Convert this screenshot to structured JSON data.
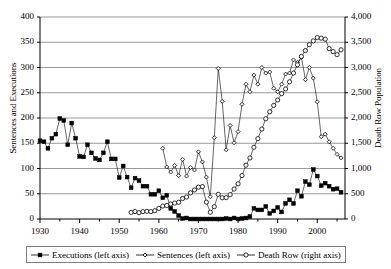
{
  "chart_data": {
    "type": "line",
    "title": "",
    "xlabel": "",
    "ylabel": "Sentences and Executions",
    "y2label": "Death Row Population",
    "xlim": [
      1930,
      2007
    ],
    "ylim": [
      0,
      400
    ],
    "y2lim": [
      0,
      4000
    ],
    "grid": true,
    "legend_position": "bottom",
    "xticks": [
      1930,
      1940,
      1950,
      1960,
      1970,
      1980,
      1990,
      2000
    ],
    "xtick_labels": [
      "1930",
      "1940",
      "1950",
      "1960",
      "1970",
      "1980",
      "1990",
      "2000"
    ],
    "yticks": [
      0,
      50,
      100,
      150,
      200,
      250,
      300,
      350,
      400
    ],
    "ytick_labels": [
      "0",
      "50",
      "100",
      "150",
      "200",
      "250",
      "300",
      "350",
      "400"
    ],
    "y2ticks": [
      0,
      500,
      1000,
      1500,
      2000,
      2500,
      3000,
      3500,
      4000
    ],
    "y2tick_labels": [
      "0",
      "500",
      "1,000",
      "1,500",
      "2,000",
      "2,500",
      "3,000",
      "3,500",
      "4,000"
    ],
    "series": [
      {
        "name": "Executions (left axis)",
        "axis": "left",
        "marker": "filled-square",
        "color": "#000000",
        "x": [
          1930,
          1931,
          1932,
          1933,
          1934,
          1935,
          1936,
          1937,
          1938,
          1939,
          1940,
          1941,
          1942,
          1943,
          1944,
          1945,
          1946,
          1947,
          1948,
          1949,
          1950,
          1951,
          1952,
          1953,
          1954,
          1955,
          1956,
          1957,
          1958,
          1959,
          1960,
          1961,
          1962,
          1963,
          1964,
          1965,
          1966,
          1967,
          1968,
          1969,
          1970,
          1971,
          1972,
          1973,
          1974,
          1975,
          1976,
          1977,
          1978,
          1979,
          1980,
          1981,
          1982,
          1983,
          1984,
          1985,
          1986,
          1987,
          1988,
          1989,
          1990,
          1991,
          1992,
          1993,
          1994,
          1995,
          1996,
          1997,
          1998,
          1999,
          2000,
          2001,
          2002,
          2003,
          2004,
          2005,
          2006
        ],
        "values": [
          155,
          153,
          140,
          160,
          168,
          199,
          195,
          147,
          190,
          160,
          124,
          123,
          147,
          131,
          120,
          117,
          131,
          153,
          119,
          119,
          82,
          105,
          83,
          62,
          81,
          76,
          65,
          65,
          49,
          49,
          56,
          42,
          47,
          21,
          15,
          7,
          1,
          2,
          0,
          0,
          0,
          0,
          0,
          0,
          0,
          0,
          0,
          1,
          0,
          2,
          0,
          1,
          2,
          5,
          21,
          18,
          18,
          25,
          11,
          16,
          23,
          14,
          31,
          38,
          31,
          56,
          45,
          74,
          68,
          98,
          85,
          66,
          71,
          65,
          59,
          60,
          53
        ]
      },
      {
        "name": "Sentences (left axis)",
        "axis": "left",
        "marker": "small-diamond",
        "color": "#000000",
        "x": [
          1961,
          1962,
          1963,
          1964,
          1965,
          1966,
          1967,
          1968,
          1969,
          1970,
          1971,
          1972,
          1973,
          1974,
          1975,
          1976,
          1977,
          1978,
          1979,
          1980,
          1981,
          1982,
          1983,
          1984,
          1985,
          1986,
          1987,
          1988,
          1989,
          1990,
          1991,
          1992,
          1993,
          1994,
          1995,
          1996,
          1997,
          1998,
          1999,
          2000,
          2001,
          2002,
          2003,
          2004,
          2005,
          2006
        ],
        "values": [
          140,
          103,
          93,
          106,
          86,
          118,
          85,
          102,
          97,
          133,
          113,
          83,
          44,
          161,
          298,
          233,
          137,
          185,
          151,
          173,
          227,
          267,
          252,
          285,
          267,
          300,
          289,
          291,
          259,
          252,
          267,
          287,
          289,
          315,
          310,
          320,
          276,
          300,
          279,
          232,
          163,
          168,
          153,
          140,
          128,
          121
        ]
      },
      {
        "name": "Death Row (right axis)",
        "axis": "right",
        "marker": "open-circle",
        "color": "#000000",
        "x": [
          1953,
          1954,
          1955,
          1956,
          1957,
          1958,
          1959,
          1960,
          1961,
          1962,
          1963,
          1964,
          1965,
          1966,
          1967,
          1968,
          1969,
          1970,
          1971,
          1972,
          1973,
          1974,
          1975,
          1976,
          1977,
          1978,
          1979,
          1980,
          1981,
          1982,
          1983,
          1984,
          1985,
          1986,
          1987,
          1988,
          1989,
          1990,
          1991,
          1992,
          1993,
          1994,
          1995,
          1996,
          1997,
          1998,
          1999,
          2000,
          2001,
          2002,
          2003,
          2004,
          2005,
          2006
        ],
        "values": [
          131,
          147,
          125,
          146,
          151,
          147,
          164,
          210,
          257,
          267,
          297,
          315,
          331,
          406,
          435,
          517,
          575,
          631,
          642,
          334,
          134,
          244,
          488,
          420,
          423,
          482,
          593,
          697,
          860,
          1066,
          1209,
          1420,
          1591,
          1781,
          1984,
          2124,
          2250,
          2356,
          2482,
          2575,
          2716,
          2890,
          3054,
          3219,
          3335,
          3452,
          3527,
          3593,
          3581,
          3562,
          3374,
          3315,
          3254,
          3350
        ]
      }
    ]
  },
  "axes": {
    "y_left_title": "Sentences and Executions",
    "y_right_title": "Death Row Population"
  },
  "legend": {
    "items": [
      {
        "label": "Executions (left axis)",
        "marker": "filled-square"
      },
      {
        "label": "Sentences (left axis)",
        "marker": "small-diamond"
      },
      {
        "label": "Death Row (right axis)",
        "marker": "open-circle"
      }
    ]
  }
}
